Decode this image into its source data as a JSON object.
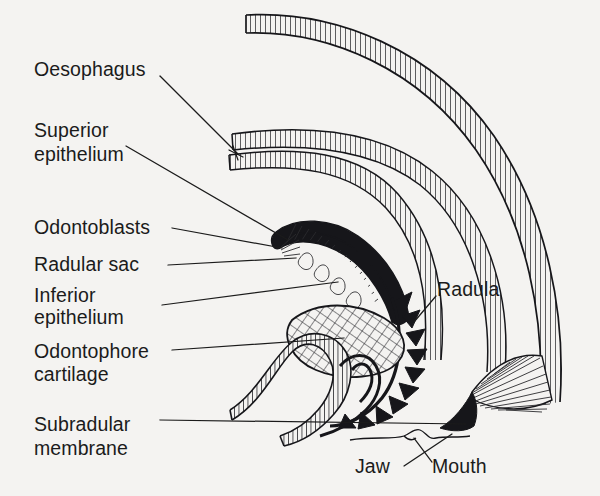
{
  "figure": {
    "background_color": "#f4f3f1",
    "ink_color": "#16161a",
    "width": 600,
    "height": 496
  },
  "labels": {
    "oesophagus": "Oesophagus",
    "superior_epithelium_line1": "Superior",
    "superior_epithelium_line2": "epithelium",
    "odontoblasts": "Odontoblasts",
    "radular_sac": "Radular  sac",
    "inferior_epithelium_line1": "Inferior",
    "inferior_epithelium_line2": "epithelium",
    "odontophore_cartilage_line1": "Odontophore",
    "odontophore_cartilage_line2": "cartilage",
    "subradular_membrane_line1": "Subradular",
    "subradular_membrane_line2": "membrane",
    "radula": "Radula",
    "jaw": "Jaw",
    "mouth": "Mouth"
  },
  "structures": [
    {
      "name": "oesophagus-upper-duct",
      "style": "ladder-hatched-tube"
    },
    {
      "name": "oesophagus-lower-duct",
      "style": "ladder-hatched-tube"
    },
    {
      "name": "outer-body-wall",
      "style": "ladder-hatched-tube"
    },
    {
      "name": "radular-sac",
      "style": "solid-outline-with-teeth"
    },
    {
      "name": "odontoblast-cells",
      "style": "fan-hatched"
    },
    {
      "name": "odontophore-cartilage",
      "style": "cross-hatched-oval"
    },
    {
      "name": "subradular-membrane",
      "style": "beaded-band"
    },
    {
      "name": "radula-teeth",
      "style": "solid-black-hooks"
    },
    {
      "name": "jaw",
      "style": "solid-black-wedge"
    },
    {
      "name": "mouth-opening",
      "style": "thin-outline"
    },
    {
      "name": "buccal-musculature-fan",
      "style": "radial-hatched"
    }
  ]
}
